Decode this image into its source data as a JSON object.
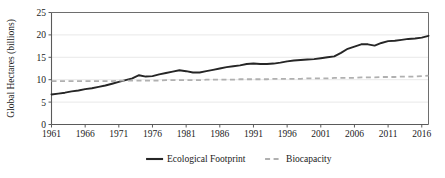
{
  "chart_data": {
    "type": "line",
    "title": "",
    "xlabel": "",
    "ylabel": "Global Hectares (billions)",
    "xlim": [
      1961,
      2017
    ],
    "ylim": [
      0,
      25
    ],
    "yticks": [
      0,
      5,
      10,
      15,
      20,
      25
    ],
    "ytick_labels": [
      "0",
      "5",
      "10",
      "15",
      "20",
      "25"
    ],
    "xticks": [
      1961,
      1966,
      1971,
      1976,
      1981,
      1986,
      1991,
      1996,
      2001,
      2006,
      2011,
      2016
    ],
    "xtick_labels": [
      "1961",
      "1966",
      "1971",
      "1976",
      "1981",
      "1986",
      "1991",
      "1996",
      "2001",
      "2006",
      "2011",
      "2016"
    ],
    "grid": "horizontal",
    "legend_position": "bottom",
    "x": [
      1961,
      1962,
      1963,
      1964,
      1965,
      1966,
      1967,
      1968,
      1969,
      1970,
      1971,
      1972,
      1973,
      1974,
      1975,
      1976,
      1977,
      1978,
      1979,
      1980,
      1981,
      1982,
      1983,
      1984,
      1985,
      1986,
      1987,
      1988,
      1989,
      1990,
      1991,
      1992,
      1993,
      1994,
      1995,
      1996,
      1997,
      1998,
      1999,
      2000,
      2001,
      2002,
      2003,
      2004,
      2005,
      2006,
      2007,
      2008,
      2009,
      2010,
      2011,
      2012,
      2013,
      2014,
      2015,
      2016,
      2017
    ],
    "series": [
      {
        "name": "Ecological Footprint",
        "color": "#262626",
        "style": "solid",
        "values": [
          6.7,
          6.9,
          7.1,
          7.4,
          7.6,
          7.9,
          8.1,
          8.4,
          8.7,
          9.1,
          9.5,
          9.9,
          10.3,
          11.0,
          10.7,
          10.8,
          11.2,
          11.5,
          11.8,
          12.1,
          11.9,
          11.6,
          11.6,
          11.9,
          12.2,
          12.5,
          12.8,
          13.0,
          13.2,
          13.5,
          13.6,
          13.5,
          13.5,
          13.6,
          13.8,
          14.1,
          14.3,
          14.4,
          14.5,
          14.6,
          14.8,
          15.0,
          15.2,
          16.0,
          16.9,
          17.4,
          17.9,
          17.9,
          17.6,
          18.2,
          18.6,
          18.7,
          18.9,
          19.1,
          19.2,
          19.4,
          19.8
        ]
      },
      {
        "name": "Biocapacity",
        "color": "#b0b0b0",
        "style": "dashed",
        "values": [
          9.7,
          9.7,
          9.7,
          9.7,
          9.7,
          9.7,
          9.7,
          9.7,
          9.7,
          9.7,
          9.8,
          9.8,
          9.8,
          9.8,
          9.8,
          9.8,
          9.8,
          9.9,
          9.9,
          9.9,
          9.9,
          9.9,
          9.9,
          10.0,
          10.0,
          10.0,
          10.0,
          10.0,
          10.1,
          10.1,
          10.1,
          10.1,
          10.1,
          10.2,
          10.2,
          10.2,
          10.2,
          10.2,
          10.3,
          10.3,
          10.3,
          10.3,
          10.4,
          10.4,
          10.4,
          10.4,
          10.5,
          10.5,
          10.5,
          10.6,
          10.6,
          10.6,
          10.7,
          10.7,
          10.7,
          10.8,
          10.9
        ]
      }
    ],
    "legend": [
      {
        "label": "Ecological Footprint",
        "color": "#262626",
        "style": "solid"
      },
      {
        "label": "Biocapacity",
        "color": "#b0b0b0",
        "style": "dashed"
      }
    ]
  }
}
